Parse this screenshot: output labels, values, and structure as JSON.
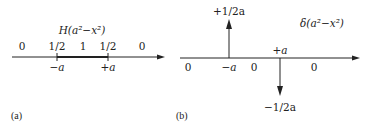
{
  "panel_a": {
    "tag": "(a)",
    "title": "H(a²−x²)",
    "values": [
      {
        "label": "0",
        "x": 22
      },
      {
        "label": "1/2",
        "x": 57
      },
      {
        "label": "1",
        "x": 83
      },
      {
        "label": "1/2",
        "x": 108
      },
      {
        "label": "0",
        "x": 142
      }
    ],
    "ticks": [
      {
        "label": "−a",
        "x": 57
      },
      {
        "label": "+a",
        "x": 108
      }
    ]
  },
  "panel_b": {
    "tag": "(b)",
    "title": "δ(a²−x²)",
    "impulse_up_label": "+1/2a",
    "impulse_down_label": "−1/2a",
    "plus_a_label": "+a",
    "axis_labels": [
      {
        "label": "0",
        "x": 188
      },
      {
        "label": "−a",
        "x": 229
      },
      {
        "label": "0",
        "x": 254
      },
      {
        "label": "0",
        "x": 314
      }
    ]
  },
  "colors": {
    "ink": "#222222",
    "background": "#ffffff"
  }
}
